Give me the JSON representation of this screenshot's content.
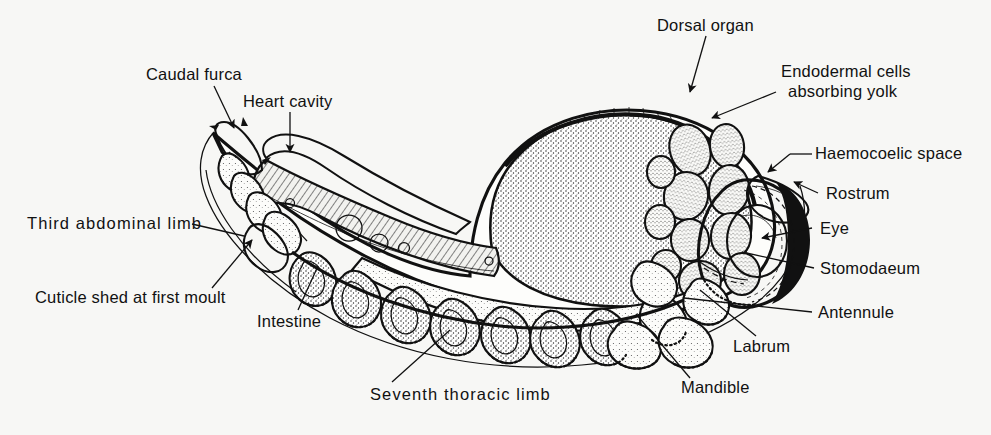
{
  "figure": {
    "background_color": "#f7f7f5",
    "ink_color": "#111111"
  },
  "labels": {
    "caudal_furca": "Caudal furca",
    "heart_cavity": "Heart cavity",
    "dorsal_organ": "Dorsal organ",
    "endodermal_cells_line1": "Endodermal cells",
    "endodermal_cells_line2": "absorbing yolk",
    "haemocoelic_space": "Haemocoelic space",
    "rostrum": "Rostrum",
    "eye": "Eye",
    "stomodaeum": "Stomodaeum",
    "antennule": "Antennule",
    "labrum": "Labrum",
    "mandible": "Mandible",
    "seventh_thoracic_limb": "Seventh thoracic limb",
    "intestine": "Intestine",
    "cuticle_shed": "Cuticle shed at first moult",
    "third_abdominal_limb": "Third abdominal limb"
  }
}
